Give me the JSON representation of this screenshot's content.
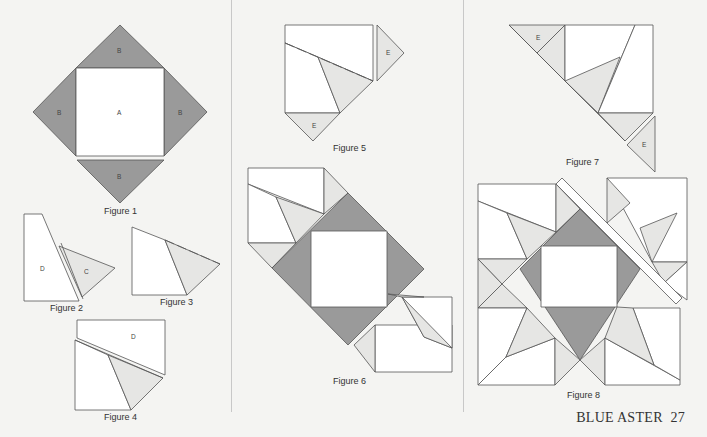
{
  "figures": {
    "f1": {
      "caption": "Figure 1",
      "labels": {
        "top": "B",
        "left": "B",
        "right": "B",
        "bottom": "B",
        "center": "A"
      }
    },
    "f2": {
      "caption": "Figure 2",
      "labels": {
        "d": "D",
        "c": "C"
      }
    },
    "f3": {
      "caption": "Figure 3"
    },
    "f4": {
      "caption": "Figure 4",
      "labels": {
        "d": "D"
      }
    },
    "f5": {
      "caption": "Figure 5",
      "labels": {
        "e1": "E",
        "e2": "E"
      }
    },
    "f6": {
      "caption": "Figure 6"
    },
    "f7": {
      "caption": "Figure 7",
      "labels": {
        "e1": "E",
        "e2": "E"
      }
    },
    "f8": {
      "caption": "Figure 8"
    }
  },
  "footer": {
    "title": "BLUE ASTER",
    "page": "27"
  },
  "colors": {
    "dark_fabric": "#9a9a9a",
    "light_fabric": "#e6e6e4",
    "background": "#f4f4f2"
  }
}
